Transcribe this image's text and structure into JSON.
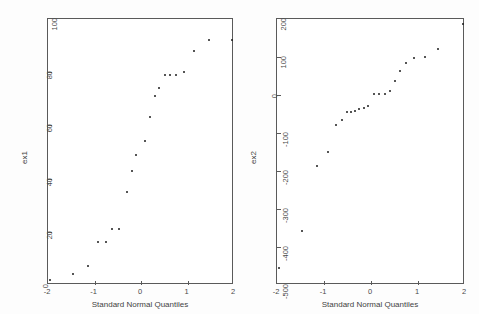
{
  "figure": {
    "background_color": "#fdfdfd",
    "plot_background_color": "#ffffff",
    "frame_color": "#5a5a5a",
    "point_color": "#1d1d1d"
  },
  "chart_data": [
    {
      "type": "scatter",
      "title": "",
      "panel_id": "left",
      "xlabel": "Standard Normal Quantiles",
      "ylabel": "ex1",
      "xlim": [
        -2,
        2
      ],
      "ylim": [
        0,
        100
      ],
      "xticks": [
        -2,
        -1,
        0,
        1,
        2
      ],
      "xticklabels": [
        "-2",
        "-1",
        "0",
        "1",
        "2"
      ],
      "yticks": [
        0,
        20,
        40,
        60,
        80,
        100
      ],
      "yticklabels": [
        "0",
        "20",
        "40",
        "60",
        "80",
        "100"
      ],
      "grid": false,
      "legend": "none",
      "marker": "dot",
      "x": [
        -1.96,
        -1.47,
        -1.15,
        -0.92,
        -0.75,
        -0.62,
        -0.47,
        -0.3,
        -0.2,
        -0.1,
        0.08,
        0.19,
        0.3,
        0.38,
        0.52,
        0.62,
        0.75,
        0.92,
        1.15,
        1.47,
        1.96
      ],
      "y": [
        2,
        4,
        7,
        16,
        16,
        21,
        21,
        35,
        43,
        49,
        54,
        63,
        71,
        74,
        79,
        79,
        79,
        80,
        88,
        92,
        92
      ]
    },
    {
      "type": "scatter",
      "title": "",
      "panel_id": "right",
      "xlabel": "Standard Normal Quantiles",
      "ylabel": "ex2",
      "xlim": [
        -2,
        2
      ],
      "ylim": [
        -500,
        200
      ],
      "xticks": [
        -2,
        -1,
        0,
        1,
        2
      ],
      "xticklabels": [
        "-2",
        "-1",
        "0",
        "1",
        "2"
      ],
      "yticks": [
        -500,
        -400,
        -300,
        -200,
        -100,
        0,
        100,
        200
      ],
      "yticklabels": [
        "-500",
        "-400",
        "-300",
        "-200",
        "-100",
        "0",
        "100",
        "200"
      ],
      "grid": false,
      "legend": "none",
      "marker": "dot",
      "x": [
        -1.96,
        -1.47,
        -1.15,
        -0.92,
        -0.75,
        -0.62,
        -0.52,
        -0.42,
        -0.33,
        -0.25,
        -0.15,
        -0.06,
        0.06,
        0.17,
        0.3,
        0.4,
        0.52,
        0.62,
        0.75,
        0.92,
        1.15,
        1.43,
        1.96
      ],
      "y": [
        -455,
        -357,
        -188,
        -150,
        -80,
        -65,
        -44,
        -46,
        -43,
        -38,
        -35,
        -29,
        3,
        3,
        3,
        11,
        38,
        62,
        85,
        97,
        101,
        120,
        188
      ]
    }
  ]
}
